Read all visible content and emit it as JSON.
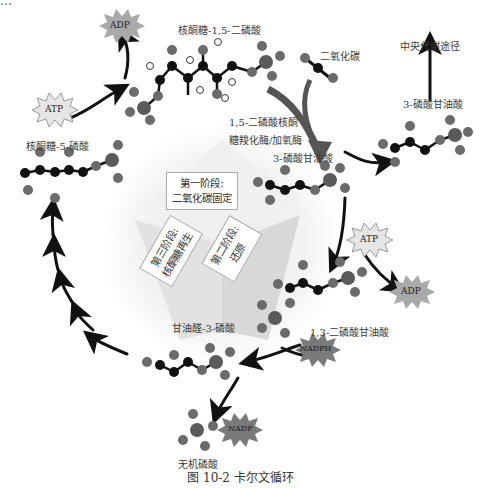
{
  "figure": {
    "caption": "图 10-2   卡尔文循环",
    "top_cut_text": "…"
  },
  "molecules": {
    "rubp": "核酮糖-1,5-二磷酸",
    "co2": "二氧化碳",
    "enzyme_line1": "1,5-二磷酸核酮",
    "enzyme_line2": "糖羧化酶/加氧酶",
    "pga_center": "3-磷酸甘油酸",
    "pga_right": "3-磷酸甘油酸",
    "central_metabolism": "中央代谢途径",
    "bpg": "1,3-二磷酸甘油酸",
    "g3p": "甘油醛-3-磷酸",
    "pi": "无机磷酸",
    "ru5p": "核酮糖-5-磷酸"
  },
  "cofactors": {
    "adp_top": "ADP",
    "atp_left": "ATP",
    "atp_right": "ATP",
    "adp_right": "ADP",
    "nadph": "NADPH",
    "nadp": "NADP"
  },
  "stages": {
    "stage1": [
      "第一阶段:",
      "二氧化碳固定"
    ],
    "stage2": [
      "第二阶段:",
      "还原"
    ],
    "stage3": [
      "第三阶段:",
      "核酮糖再生"
    ]
  },
  "colors": {
    "carbon": "#111111",
    "oxygen": "#6b6b6b",
    "phosphorus": "#5a5a5a",
    "hydrogen": "#ffffff",
    "arrow": "#111111",
    "co2_arrow": "#555555",
    "star_fill": "#a9a9a9",
    "star_light": "#e6e6e6"
  }
}
